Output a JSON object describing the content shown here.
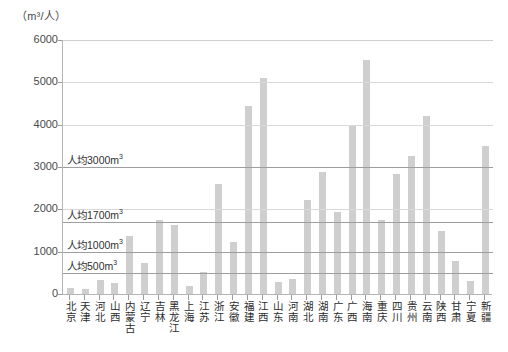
{
  "chart_data": {
    "type": "bar",
    "title": "",
    "unit_caption": "（m³/人）",
    "xlabel": "",
    "ylabel": "",
    "ylim": [
      0,
      6000
    ],
    "grid": true,
    "legend": "none",
    "y_ticks": [
      6000,
      5000,
      4000,
      3000,
      2000,
      1000,
      0
    ],
    "categories": [
      "北京",
      "天津",
      "河北",
      "山西",
      "内蒙古",
      "辽宁",
      "吉林",
      "黑龙江",
      "上海",
      "江苏",
      "浙江",
      "安徽",
      "福建",
      "江西",
      "山东",
      "河南",
      "湖北",
      "湖南",
      "广东",
      "广西",
      "海南",
      "重庆",
      "四川",
      "贵州",
      "云南",
      "陕西",
      "甘肃",
      "宁夏",
      "新疆"
    ],
    "values": [
      150,
      120,
      320,
      260,
      1370,
      730,
      1740,
      1640,
      190,
      520,
      2600,
      1220,
      4450,
      5100,
      280,
      350,
      2230,
      2890,
      1930,
      3960,
      5520,
      1750,
      2830,
      3250,
      4200,
      1490,
      780,
      300,
      3500
    ],
    "reference_lines": [
      {
        "value": 3000,
        "label": "人均3000m³"
      },
      {
        "value": 1700,
        "label": "人均1700m³"
      },
      {
        "value": 1000,
        "label": "人均1000m³"
      },
      {
        "value": 500,
        "label": "人均500m³"
      }
    ],
    "colors": {
      "bar": "#cfcfcf",
      "axis": "#b5b5b5",
      "gridline": "#d9d9d9",
      "refline": "#9e9e9e",
      "text": "#2f2f2f"
    }
  }
}
